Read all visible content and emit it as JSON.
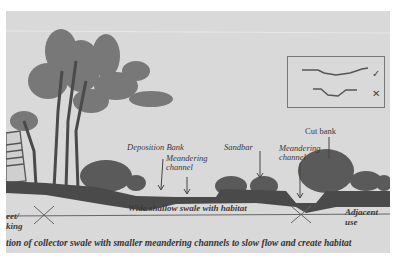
{
  "diagram": {
    "caption": "tion of collector swale with smaller meandering channels to slow flow and create habitat",
    "labels": {
      "deposition_bank": "Deposition Bank",
      "meandering_channel_left_1": "Meandering",
      "meandering_channel_left_2": "channel",
      "sandbar": "Sandbar",
      "meandering_channel_right_1": "Meandering",
      "meandering_channel_right_2": "channel",
      "cut_bank": "Cut bank",
      "swale": "Wide shallow swale with habitat",
      "adjacent_use_1": "Adjacent",
      "adjacent_use_2": "use",
      "street_parking_1": "eet/",
      "street_parking_2": "king"
    },
    "legend": {
      "items": [
        {
          "profile": "wide-meandering",
          "mark": "✓",
          "meaning": "correct"
        },
        {
          "profile": "narrow-trapezoidal",
          "mark": "✕",
          "meaning": "incorrect"
        }
      ]
    },
    "colors": {
      "paper": "#d9d9d9",
      "ink": "#3a3a3a",
      "ground": "#4a4a4a"
    }
  }
}
